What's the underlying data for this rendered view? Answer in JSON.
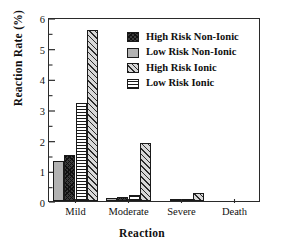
{
  "chart_data": {
    "type": "bar",
    "title": "",
    "xlabel": "Reaction",
    "ylabel": "Reaction Rate (%)",
    "categories": [
      "Mild",
      "Moderate",
      "Severe",
      "Death"
    ],
    "ylim": [
      0,
      6
    ],
    "yticks": [
      0,
      1,
      2,
      3,
      4,
      5,
      6
    ],
    "ytick_labels": [
      "0",
      "1",
      "2",
      "3",
      "4",
      "5",
      "6"
    ],
    "yminor_ticks": [
      0.5,
      1.5,
      2.5,
      3.5,
      4.5,
      5.5
    ],
    "grid": false,
    "legend_position": "upper right",
    "series": [
      {
        "name": "High Risk Non-Ionic",
        "pattern": "crosshatch-dark",
        "color": "#3a3a3a",
        "draw_order": 2,
        "values": [
          1.5,
          0.13,
          0.02,
          0.0
        ]
      },
      {
        "name": "Low Risk Non-Ionic",
        "pattern": "solid-gray",
        "color": "#b2b2b2",
        "draw_order": 1,
        "values": [
          1.3,
          0.1,
          0.0,
          0.0
        ]
      },
      {
        "name": "High Risk Ionic",
        "pattern": "diagonal-light",
        "color": "#d8d8d8",
        "draw_order": 4,
        "values": [
          5.58,
          1.88,
          0.26,
          0.0
        ]
      },
      {
        "name": "Low Risk Ionic",
        "pattern": "horizontal",
        "color": "#ffffff",
        "draw_order": 3,
        "values": [
          3.18,
          0.2,
          0.08,
          0.0
        ]
      }
    ]
  }
}
